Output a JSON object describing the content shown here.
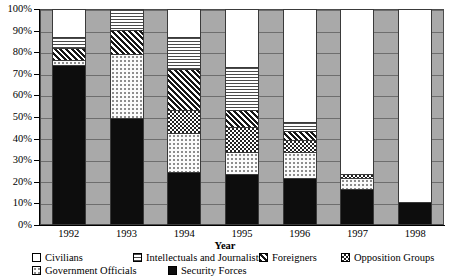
{
  "chart_data": {
    "type": "bar",
    "subtype": "stacked-100-percent",
    "title": "",
    "xlabel": "Year",
    "ylabel": "",
    "categories": [
      "1992",
      "1993",
      "1994",
      "1995",
      "1996",
      "1997",
      "1998"
    ],
    "ylim": [
      0,
      100
    ],
    "ytick_labels": [
      "0%",
      "10%",
      "20%",
      "30%",
      "40%",
      "50%",
      "60%",
      "70%",
      "80%",
      "90%",
      "100%"
    ],
    "ytick_values": [
      0,
      10,
      20,
      30,
      40,
      50,
      60,
      70,
      80,
      90,
      100
    ],
    "grid": true,
    "legend_position": "bottom",
    "stack_order_bottom_to_top": [
      "Security Forces",
      "Government Officials",
      "Opposition Groups",
      "Foreigners",
      "Intellectuals and Journalists",
      "Civilians"
    ],
    "series": [
      {
        "name": "Security Forces",
        "key": "security",
        "pattern": "solid-black",
        "values": [
          74,
          49,
          24,
          23,
          21,
          16,
          10
        ]
      },
      {
        "name": "Government Officials",
        "key": "government",
        "pattern": "fine-dots",
        "values": [
          2,
          30,
          18,
          10,
          12,
          5,
          0
        ]
      },
      {
        "name": "Opposition Groups",
        "key": "opposition",
        "pattern": "checkerboard",
        "values": [
          0,
          0,
          11,
          12,
          6,
          2,
          0
        ]
      },
      {
        "name": "Foreigners",
        "key": "foreigners",
        "pattern": "diagonal-hatch",
        "values": [
          6,
          11,
          19,
          8,
          4,
          0,
          0
        ]
      },
      {
        "name": "Intellectuals and Journalists",
        "key": "intellectuals",
        "pattern": "horizontal-lines",
        "values": [
          5,
          10,
          15,
          20,
          4,
          0,
          0
        ]
      },
      {
        "name": "Civilians",
        "key": "civilians",
        "pattern": "white",
        "values": [
          13,
          0,
          13,
          27,
          53,
          77,
          90
        ]
      }
    ]
  },
  "legend": {
    "row1": [
      {
        "label": "Civilians",
        "key": "civilians"
      },
      {
        "label": "Intellectuals and Journalists",
        "key": "intellectuals"
      },
      {
        "label": "Foreigners",
        "key": "foreigners"
      },
      {
        "label": "Opposition Groups",
        "key": "opposition"
      }
    ],
    "row2": [
      {
        "label": "Government Officials",
        "key": "government"
      },
      {
        "label": "Security Forces",
        "key": "security"
      }
    ]
  },
  "colors": {
    "plot_background": "#a9a9a9",
    "gridline": "#6e6e6e",
    "axis": "#000000",
    "bar_outline": "#3a3a3a",
    "security_fill": "#0d0d0d",
    "civilians_fill": "#ffffff"
  }
}
